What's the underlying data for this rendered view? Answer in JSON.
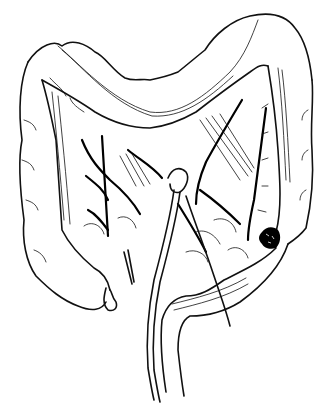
{
  "figure": {
    "description": "Black-and-white line illustration of the large intestine (colon) with mesenteric blood vessels, surgical instruments, and a dark lesion on the descending colon",
    "ink_color": "#111111",
    "background_color": "#ffffff",
    "lesion_color": "#000000"
  }
}
